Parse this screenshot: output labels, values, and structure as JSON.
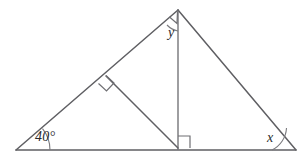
{
  "figure": {
    "background_color": "#ffffff",
    "line_color": "#5f5f63",
    "label_color": "#2b2b2e",
    "labels": {
      "left_angle": "40°",
      "apex_angle": "y",
      "right_angle_vertex": "x"
    },
    "vertices": {
      "left": {
        "name": "left-vertex",
        "x": 16,
        "y": 150
      },
      "apex": {
        "name": "apex-vertex",
        "x": 178,
        "y": 10
      },
      "right": {
        "name": "right-vertex",
        "x": 296,
        "y": 150
      },
      "altitude_foot": {
        "name": "altitude-foot",
        "x": 178,
        "y": 148
      },
      "cevian_foot_on_left_side": {
        "name": "perpendicular-foot-left-side",
        "x": 106,
        "y": 76
      }
    },
    "segments": [
      {
        "name": "base-line",
        "from": "left",
        "to": "right"
      },
      {
        "name": "left-side-line",
        "from": "left",
        "to": "apex"
      },
      {
        "name": "right-side-line",
        "from": "apex",
        "to": "right"
      },
      {
        "name": "altitude-line",
        "from": "apex",
        "to": "altitude_foot"
      },
      {
        "name": "cevian-line",
        "from": "cevian_foot_on_left_side",
        "to": "altitude_foot"
      }
    ],
    "right_angle_markers": [
      {
        "name": "right-angle-at-cevian-foot",
        "at": "cevian_foot_on_left_side"
      },
      {
        "name": "right-angle-at-altitude-foot",
        "at": "altitude_foot"
      },
      {
        "name": "right-angle-at-apex",
        "at": "apex"
      }
    ],
    "angle_arcs": [
      {
        "name": "arc-left-40deg",
        "at": "left"
      },
      {
        "name": "arc-apex-y",
        "at": "apex"
      },
      {
        "name": "arc-right-x",
        "at": "right"
      }
    ]
  }
}
